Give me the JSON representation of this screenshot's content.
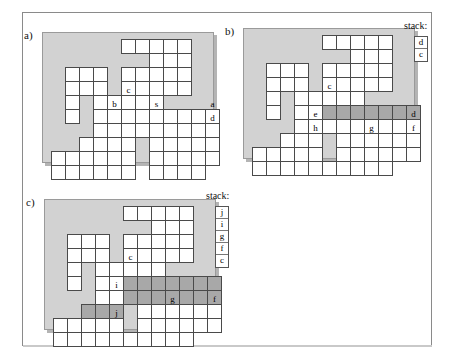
{
  "figure": {
    "kind": "grid-maze-search-states",
    "cell_px": 14,
    "colors": {
      "board_background": "#d2d2d2",
      "cell_fill": "#ffffff",
      "cell_highlight": "#a8a8a8",
      "cell_border": "#4a4a4a",
      "page_border": "#8a8a8a"
    }
  },
  "panels": [
    {
      "id": "a",
      "label": "a)",
      "board": {
        "left": 42,
        "top": 32,
        "width": 172,
        "height": 131
      },
      "has_stack": false,
      "stack_title": "",
      "stack": [],
      "cells": [
        {
          "c": 5,
          "r": 0
        },
        {
          "c": 6,
          "r": 0
        },
        {
          "c": 7,
          "r": 0
        },
        {
          "c": 8,
          "r": 0
        },
        {
          "c": 9,
          "r": 0
        },
        {
          "c": 7,
          "r": 1
        },
        {
          "c": 8,
          "r": 1
        },
        {
          "c": 9,
          "r": 1
        },
        {
          "c": 1,
          "r": 2
        },
        {
          "c": 2,
          "r": 2
        },
        {
          "c": 3,
          "r": 2
        },
        {
          "c": 5,
          "r": 2
        },
        {
          "c": 6,
          "r": 2
        },
        {
          "c": 7,
          "r": 2
        },
        {
          "c": 8,
          "r": 2
        },
        {
          "c": 9,
          "r": 2
        },
        {
          "c": 1,
          "r": 3
        },
        {
          "c": 2,
          "r": 3
        },
        {
          "c": 3,
          "r": 3
        },
        {
          "c": 5,
          "r": 3
        },
        {
          "c": 6,
          "r": 3
        },
        {
          "c": 7,
          "r": 3
        },
        {
          "c": 8,
          "r": 3
        },
        {
          "c": 9,
          "r": 3
        },
        {
          "c": 1,
          "r": 4
        },
        {
          "c": 3,
          "r": 4
        },
        {
          "c": 4,
          "r": 4
        },
        {
          "c": 5,
          "r": 4,
          "t": "c"
        },
        {
          "c": 6,
          "r": 4
        },
        {
          "c": 7,
          "r": 4
        },
        {
          "c": 1,
          "r": 5
        },
        {
          "c": 3,
          "r": 5
        },
        {
          "c": 4,
          "r": 5,
          "t": "b"
        },
        {
          "c": 5,
          "r": 5
        },
        {
          "c": 6,
          "r": 5
        },
        {
          "c": 7,
          "r": 5,
          "t": "s"
        },
        {
          "c": 8,
          "r": 5
        },
        {
          "c": 9,
          "r": 5
        },
        {
          "c": 10,
          "r": 5
        },
        {
          "c": 11,
          "r": 5,
          "t": "a"
        },
        {
          "c": 3,
          "r": 6
        },
        {
          "c": 4,
          "r": 6
        },
        {
          "c": 5,
          "r": 6
        },
        {
          "c": 6,
          "r": 6
        },
        {
          "c": 7,
          "r": 6
        },
        {
          "c": 8,
          "r": 6
        },
        {
          "c": 9,
          "r": 6
        },
        {
          "c": 10,
          "r": 6
        },
        {
          "c": 11,
          "r": 6,
          "t": "d"
        },
        {
          "c": 2,
          "r": 7
        },
        {
          "c": 3,
          "r": 7
        },
        {
          "c": 4,
          "r": 7
        },
        {
          "c": 5,
          "r": 7
        },
        {
          "c": 7,
          "r": 7
        },
        {
          "c": 8,
          "r": 7
        },
        {
          "c": 9,
          "r": 7
        },
        {
          "c": 10,
          "r": 7
        },
        {
          "c": 11,
          "r": 7
        },
        {
          "c": 0,
          "r": 8
        },
        {
          "c": 1,
          "r": 8
        },
        {
          "c": 2,
          "r": 8
        },
        {
          "c": 3,
          "r": 8
        },
        {
          "c": 4,
          "r": 8
        },
        {
          "c": 5,
          "r": 8
        },
        {
          "c": 7,
          "r": 8
        },
        {
          "c": 8,
          "r": 8
        },
        {
          "c": 9,
          "r": 8
        },
        {
          "c": 10,
          "r": 8
        },
        {
          "c": 11,
          "r": 8
        },
        {
          "c": 0,
          "r": 9
        },
        {
          "c": 1,
          "r": 9
        },
        {
          "c": 2,
          "r": 9
        },
        {
          "c": 3,
          "r": 9
        },
        {
          "c": 4,
          "r": 9
        },
        {
          "c": 5,
          "r": 9
        },
        {
          "c": 7,
          "r": 9
        },
        {
          "c": 8,
          "r": 9
        },
        {
          "c": 9,
          "r": 9
        },
        {
          "c": 10,
          "r": 9
        }
      ]
    },
    {
      "id": "b",
      "label": "b)",
      "board": {
        "left": 243,
        "top": 28,
        "width": 172,
        "height": 131
      },
      "has_stack": true,
      "stack_title": "stack:",
      "stack": [
        "d",
        "c"
      ],
      "stack_pos": {
        "left": 414,
        "top": 36
      },
      "stack_title_pos": {
        "left": 404,
        "top": 21
      },
      "cells": [
        {
          "c": 5,
          "r": 0
        },
        {
          "c": 6,
          "r": 0
        },
        {
          "c": 7,
          "r": 0
        },
        {
          "c": 8,
          "r": 0
        },
        {
          "c": 9,
          "r": 0
        },
        {
          "c": 7,
          "r": 1
        },
        {
          "c": 8,
          "r": 1
        },
        {
          "c": 9,
          "r": 1
        },
        {
          "c": 1,
          "r": 2
        },
        {
          "c": 2,
          "r": 2
        },
        {
          "c": 3,
          "r": 2
        },
        {
          "c": 5,
          "r": 2
        },
        {
          "c": 6,
          "r": 2
        },
        {
          "c": 7,
          "r": 2
        },
        {
          "c": 8,
          "r": 2
        },
        {
          "c": 9,
          "r": 2
        },
        {
          "c": 1,
          "r": 3
        },
        {
          "c": 2,
          "r": 3
        },
        {
          "c": 3,
          "r": 3
        },
        {
          "c": 5,
          "r": 3
        },
        {
          "c": 6,
          "r": 3
        },
        {
          "c": 7,
          "r": 3
        },
        {
          "c": 8,
          "r": 3
        },
        {
          "c": 9,
          "r": 3
        },
        {
          "c": 1,
          "r": 4
        },
        {
          "c": 3,
          "r": 4
        },
        {
          "c": 4,
          "r": 4
        },
        {
          "c": 5,
          "r": 4,
          "t": "c"
        },
        {
          "c": 6,
          "r": 4
        },
        {
          "c": 7,
          "r": 4
        },
        {
          "c": 1,
          "r": 5
        },
        {
          "c": 3,
          "r": 5
        },
        {
          "c": 4,
          "r": 5
        },
        {
          "c": 5,
          "r": 5,
          "h": true
        },
        {
          "c": 6,
          "r": 5,
          "h": true
        },
        {
          "c": 7,
          "r": 5,
          "h": true
        },
        {
          "c": 8,
          "r": 5,
          "h": true
        },
        {
          "c": 9,
          "r": 5,
          "h": true
        },
        {
          "c": 10,
          "r": 5,
          "h": true
        },
        {
          "c": 11,
          "r": 5,
          "h": true
        },
        {
          "c": 3,
          "r": 6
        },
        {
          "c": 4,
          "r": 6,
          "t": "e"
        },
        {
          "c": 5,
          "r": 6
        },
        {
          "c": 6,
          "r": 6
        },
        {
          "c": 7,
          "r": 6
        },
        {
          "c": 8,
          "r": 6
        },
        {
          "c": 9,
          "r": 6
        },
        {
          "c": 10,
          "r": 6
        },
        {
          "c": 11,
          "r": 6,
          "t": "d"
        },
        {
          "c": 2,
          "r": 7
        },
        {
          "c": 3,
          "r": 7
        },
        {
          "c": 4,
          "r": 7,
          "t": "h"
        },
        {
          "c": 6,
          "r": 7
        },
        {
          "c": 7,
          "r": 7
        },
        {
          "c": 8,
          "r": 7,
          "t": "g"
        },
        {
          "c": 9,
          "r": 7
        },
        {
          "c": 10,
          "r": 7
        },
        {
          "c": 11,
          "r": 7,
          "t": "f"
        },
        {
          "c": 0,
          "r": 8
        },
        {
          "c": 1,
          "r": 8
        },
        {
          "c": 2,
          "r": 8
        },
        {
          "c": 3,
          "r": 8
        },
        {
          "c": 4,
          "r": 8
        },
        {
          "c": 6,
          "r": 8
        },
        {
          "c": 7,
          "r": 8
        },
        {
          "c": 8,
          "r": 8
        },
        {
          "c": 9,
          "r": 8
        },
        {
          "c": 10,
          "r": 8
        },
        {
          "c": 11,
          "r": 8
        },
        {
          "c": 0,
          "r": 9
        },
        {
          "c": 1,
          "r": 9
        },
        {
          "c": 2,
          "r": 9
        },
        {
          "c": 3,
          "r": 9
        },
        {
          "c": 4,
          "r": 9
        },
        {
          "c": 5,
          "r": 9
        },
        {
          "c": 6,
          "r": 9
        },
        {
          "c": 7,
          "r": 9
        },
        {
          "c": 8,
          "r": 9
        },
        {
          "c": 9,
          "r": 9
        }
      ]
    },
    {
      "id": "c",
      "label": "c)",
      "board": {
        "left": 44,
        "top": 199,
        "width": 172,
        "height": 131
      },
      "has_stack": true,
      "stack_title": "stack:",
      "stack": [
        "j",
        "i",
        "g",
        "f",
        "c"
      ],
      "stack_pos": {
        "left": 215,
        "top": 206
      },
      "stack_title_pos": {
        "left": 206,
        "top": 191
      },
      "cells": [
        {
          "c": 5,
          "r": 0
        },
        {
          "c": 6,
          "r": 0
        },
        {
          "c": 7,
          "r": 0
        },
        {
          "c": 8,
          "r": 0
        },
        {
          "c": 9,
          "r": 0
        },
        {
          "c": 7,
          "r": 1
        },
        {
          "c": 8,
          "r": 1
        },
        {
          "c": 9,
          "r": 1
        },
        {
          "c": 1,
          "r": 2
        },
        {
          "c": 2,
          "r": 2
        },
        {
          "c": 3,
          "r": 2
        },
        {
          "c": 5,
          "r": 2
        },
        {
          "c": 6,
          "r": 2
        },
        {
          "c": 7,
          "r": 2
        },
        {
          "c": 8,
          "r": 2
        },
        {
          "c": 9,
          "r": 2
        },
        {
          "c": 1,
          "r": 3
        },
        {
          "c": 2,
          "r": 3
        },
        {
          "c": 3,
          "r": 3
        },
        {
          "c": 5,
          "r": 3
        },
        {
          "c": 6,
          "r": 3
        },
        {
          "c": 7,
          "r": 3
        },
        {
          "c": 8,
          "r": 3
        },
        {
          "c": 9,
          "r": 3
        },
        {
          "c": 1,
          "r": 4
        },
        {
          "c": 3,
          "r": 4
        },
        {
          "c": 4,
          "r": 4
        },
        {
          "c": 5,
          "r": 4,
          "t": "c"
        },
        {
          "c": 6,
          "r": 4
        },
        {
          "c": 7,
          "r": 4
        },
        {
          "c": 1,
          "r": 5
        },
        {
          "c": 3,
          "r": 5
        },
        {
          "c": 4,
          "r": 5
        },
        {
          "c": 5,
          "r": 5,
          "h": true
        },
        {
          "c": 6,
          "r": 5,
          "h": true
        },
        {
          "c": 7,
          "r": 5,
          "h": true
        },
        {
          "c": 8,
          "r": 5,
          "h": true
        },
        {
          "c": 9,
          "r": 5,
          "h": true
        },
        {
          "c": 10,
          "r": 5,
          "h": true
        },
        {
          "c": 11,
          "r": 5,
          "h": true
        },
        {
          "c": 3,
          "r": 6
        },
        {
          "c": 4,
          "r": 6,
          "t": "i"
        },
        {
          "c": 5,
          "r": 6,
          "h": true
        },
        {
          "c": 6,
          "r": 6,
          "h": true
        },
        {
          "c": 7,
          "r": 6,
          "h": true
        },
        {
          "c": 8,
          "r": 6,
          "h": true
        },
        {
          "c": 9,
          "r": 6,
          "h": true
        },
        {
          "c": 10,
          "r": 6,
          "h": true
        },
        {
          "c": 11,
          "r": 6,
          "h": true
        },
        {
          "c": 2,
          "r": 7,
          "h": true
        },
        {
          "c": 3,
          "r": 7,
          "h": true
        },
        {
          "c": 4,
          "r": 7,
          "h": true
        },
        {
          "c": 6,
          "r": 7
        },
        {
          "c": 7,
          "r": 7
        },
        {
          "c": 8,
          "r": 7,
          "t": "g"
        },
        {
          "c": 9,
          "r": 7
        },
        {
          "c": 10,
          "r": 7
        },
        {
          "c": 11,
          "r": 7,
          "t": "f"
        },
        {
          "c": 0,
          "r": 8
        },
        {
          "c": 1,
          "r": 8
        },
        {
          "c": 2,
          "r": 8
        },
        {
          "c": 3,
          "r": 8
        },
        {
          "c": 4,
          "r": 8,
          "t": "j"
        },
        {
          "c": 6,
          "r": 8
        },
        {
          "c": 7,
          "r": 8
        },
        {
          "c": 8,
          "r": 8
        },
        {
          "c": 9,
          "r": 8
        },
        {
          "c": 10,
          "r": 8
        },
        {
          "c": 11,
          "r": 8
        },
        {
          "c": 0,
          "r": 9
        },
        {
          "c": 1,
          "r": 9
        },
        {
          "c": 2,
          "r": 9
        },
        {
          "c": 3,
          "r": 9
        },
        {
          "c": 4,
          "r": 9
        },
        {
          "c": 5,
          "r": 9
        },
        {
          "c": 6,
          "r": 9
        },
        {
          "c": 7,
          "r": 9
        },
        {
          "c": 8,
          "r": 9
        },
        {
          "c": 9,
          "r": 9
        }
      ]
    }
  ]
}
